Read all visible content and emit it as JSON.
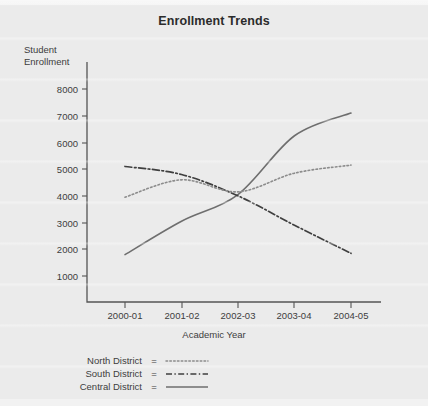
{
  "chart_data": {
    "type": "line",
    "title": "Enrollment Trends",
    "xlabel": "Academic Year",
    "ylabel": "Student\nEnrollment",
    "categories": [
      "2000-01",
      "2001-02",
      "2002-03",
      "2003-04",
      "2004-05"
    ],
    "ylim": [
      0,
      8600
    ],
    "yticks": [
      1000,
      2000,
      3000,
      4000,
      5000,
      6000,
      7000,
      8000
    ],
    "grid": false,
    "legend_position": "below-plot-left",
    "series": [
      {
        "name": "North District",
        "style": "dotted",
        "values": [
          3950,
          4600,
          4150,
          4850,
          5150
        ]
      },
      {
        "name": "South District",
        "style": "dash-dot",
        "values": [
          5100,
          4800,
          4000,
          2900,
          1850
        ]
      },
      {
        "name": "Central District",
        "style": "solid",
        "values": [
          1800,
          3050,
          4050,
          6250,
          7100
        ]
      }
    ]
  },
  "legend": {
    "separator": "=",
    "entries": [
      {
        "label": "North District",
        "style": "dotted"
      },
      {
        "label": "South District",
        "style": "dash-dot"
      },
      {
        "label": "Central District",
        "style": "solid"
      }
    ]
  },
  "colors": {
    "background": "#ebebeb",
    "ink": "#3d3d3d",
    "axis": "#555555",
    "north_series": "#8c8c8c",
    "south_series": "#3f3f3f",
    "central_series": "#6e6e6e"
  }
}
